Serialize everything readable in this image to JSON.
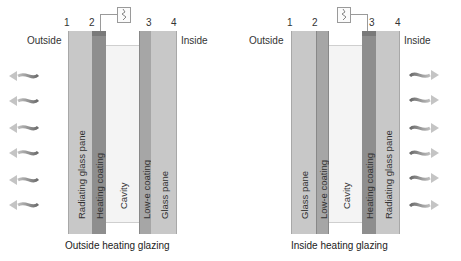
{
  "diagrams": [
    {
      "id": "outside",
      "caption": "Outside heating glazing",
      "side_left": "Outside",
      "side_right": "Inside",
      "numbers": [
        "1",
        "2",
        "3",
        "4"
      ],
      "layers": [
        {
          "label": "Radiating glass pane",
          "color": "#c8c8c8"
        },
        {
          "label": "Heating coating",
          "color": "#8e8e8e"
        },
        {
          "label": "Cavity",
          "color": "#f4f4f4"
        },
        {
          "label": "Low-e coating",
          "color": "#a6a6a6"
        },
        {
          "label": "Glass pane",
          "color": "#c8c8c8"
        }
      ],
      "heat_direction": "left",
      "arrow_count": 6
    },
    {
      "id": "inside",
      "caption": "Inside heating glazing",
      "side_left": "Outside",
      "side_right": "Inside",
      "numbers": [
        "1",
        "2",
        "3",
        "4"
      ],
      "layers": [
        {
          "label": "Glass pane",
          "color": "#c8c8c8"
        },
        {
          "label": "Low-e coating",
          "color": "#a6a6a6"
        },
        {
          "label": "Cavity",
          "color": "#f4f4f4"
        },
        {
          "label": "Heating coating",
          "color": "#8e8e8e"
        },
        {
          "label": "Radiating glass pane",
          "color": "#c8c8c8"
        }
      ],
      "heat_direction": "right",
      "arrow_count": 6
    }
  ],
  "icons": {
    "heater": "heating-element-icon",
    "arrow": "heat-radiation-arrow-icon"
  }
}
